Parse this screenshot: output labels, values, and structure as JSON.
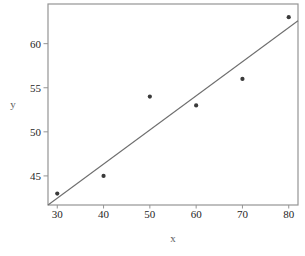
{
  "figure": {
    "background": "#ffffff"
  },
  "chart_data": {
    "type": "scatter",
    "title": "",
    "xlabel": "x",
    "ylabel": "y",
    "points": [
      {
        "x": 30,
        "y": 43
      },
      {
        "x": 40,
        "y": 45
      },
      {
        "x": 50,
        "y": 54
      },
      {
        "x": 60,
        "y": 53
      },
      {
        "x": 70,
        "y": 56
      },
      {
        "x": 80,
        "y": 63
      }
    ],
    "fit_line": {
      "x1": 28,
      "y1": 41.7,
      "x2": 82,
      "y2": 62.6
    },
    "x_ticks": [
      30,
      40,
      50,
      60,
      70,
      80
    ],
    "y_ticks": [
      45,
      50,
      55,
      60
    ],
    "xlim": [
      28,
      82
    ],
    "ylim": [
      41.7,
      64.5
    ],
    "grid": false,
    "legend": null,
    "colors": {
      "frame": "#949494",
      "fit_line": "#6e6e6e",
      "point": "#3a3a3a",
      "tick_label": "#262626",
      "axis_label": "#5f5f5f",
      "background": "#ffffff"
    }
  }
}
